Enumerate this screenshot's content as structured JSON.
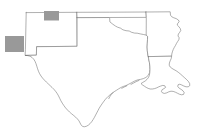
{
  "figure": {
    "background_color": "#ffffff",
    "width": 205,
    "height": 140
  },
  "map": {
    "projection_note": "plate-carree-like outline map",
    "outline_color": "#6e6e6e",
    "outline_width": 0.55,
    "fill_color": "#ffffff",
    "states": [
      {
        "id": "new-mexico",
        "name": "New Mexico"
      },
      {
        "id": "texas",
        "name": "Texas"
      },
      {
        "id": "oklahoma",
        "name": "Oklahoma"
      },
      {
        "id": "arkansas",
        "name": "Arkansas"
      },
      {
        "id": "louisiana",
        "name": "Louisiana"
      }
    ],
    "highlight_color": "#999999",
    "highlight_regions": [
      {
        "id": "highlight-region-north",
        "label": "Northern highlighted study area",
        "state": "New Mexico",
        "x": 44.0,
        "y": 11.0,
        "width": 15.0,
        "height": 9.5
      },
      {
        "id": "highlight-region-west",
        "label": "Western highlighted study area",
        "state": "New Mexico",
        "x": 5.0,
        "y": 36.0,
        "width": 19.0,
        "height": 16.0
      }
    ]
  },
  "geometry": {
    "new_mexico": "M 26.0 12.4 L 77.0 12.1 L 77.3 17.5 L 77.4 46.0 L 36.5 46.5 L 36.3 55.0 L 25.0 55.2 L 25.2 50.0 L 26.0 12.4 Z",
    "texas": "M 77.4 17.5 L 110.0 17.4 L 110.2 21.6 L 115.5 26.5 L 120.0 28.0 L 124.0 30.5 L 129.5 31.0 L 134.0 33.0 L 139.5 33.5 L 144.0 34.6 L 147.5 35.2 L 149.0 37.0 L 148.5 41.0 L 148.0 46.0 L 148.2 50.5 L 149.0 56.0 L 150.2 62.0 L 150.6 67.5 L 150.4 72.0 L 149.0 76.0 L 146.0 78.8 L 142.0 80.2 L 138.0 81.0 L 133.0 83.0 L 128.5 85.5 L 125.0 88.0 L 121.5 89.0 L 118.0 90.5 L 114.5 92.5 L 111.0 95.0 L 108.0 97.5 L 105.5 100.0 L 103.0 103.0 L 100.5 106.5 L 98.5 110.0 L 96.5 113.5 L 94.5 117.0 L 92.5 120.5 L 90.5 123.5 L 88.0 126.0 L 85.0 127.8 L 82.0 128.2 L 79.5 126.5 L 78.0 123.5 L 76.5 120.0 L 74.0 117.0 L 71.0 114.5 L 68.0 112.0 L 65.0 109.0 L 62.5 105.5 L 60.0 102.0 L 58.0 98.5 L 56.5 95.0 L 55.0 91.5 L 53.0 88.5 L 50.5 86.0 L 48.0 83.5 L 45.5 81.0 L 43.0 78.5 L 40.5 76.0 L 38.0 73.5 L 36.0 70.5 L 34.5 67.0 L 33.5 63.5 L 32.5 60.0 L 31.0 57.5 L 28.5 56.0 L 25.0 55.2 L 36.3 55.0 L 36.5 46.5 L 77.4 46.0 L 77.3 17.5 Z",
    "oklahoma": "M 77.0 12.1 L 110.0 12.0 L 146.5 12.0 L 146.8 17.3 L 110.2 17.4 L 110.0 17.4 L 77.4 17.5 L 77.0 12.1 Z",
    "arkansas": "M 146.8 17.3 L 146.5 12.0 L 170.5 11.8 L 170.8 16.0 L 173.0 18.5 L 176.5 20.0 L 179.5 22.5 L 178.0 25.0 L 180.0 27.5 L 182.0 30.5 L 181.0 33.5 L 179.0 36.5 L 180.5 39.5 L 179.0 42.5 L 177.5 45.5 L 176.0 48.5 L 174.5 51.5 L 173.0 54.5 L 172.0 57.5 L 148.2 57.8 L 148.0 46.0 L 148.5 41.0 L 149.0 37.0 L 147.5 35.2 L 146.8 17.3 Z",
    "louisiana": "M 148.2 57.8 L 172.0 57.5 L 171.5 60.5 L 170.0 63.5 L 169.5 66.5 L 171.0 69.0 L 173.5 70.5 L 176.0 72.0 L 178.5 73.5 L 181.0 75.5 L 183.0 78.0 L 185.5 80.0 L 188.0 82.0 L 190.5 84.5 L 191.0 87.5 L 189.0 89.5 L 186.0 90.0 L 183.0 89.0 L 180.5 87.5 L 178.0 86.5 L 176.0 88.0 L 177.5 90.5 L 180.0 92.0 L 182.5 93.5 L 184.0 96.0 L 183.0 98.5 L 180.5 99.0 L 178.0 98.0 L 175.5 96.5 L 173.0 95.0 L 170.5 94.0 L 168.0 93.5 L 165.5 94.5 L 163.0 96.0 L 160.5 97.0 L 158.0 96.0 L 156.5 93.5 L 158.0 91.0 L 160.5 90.0 L 162.5 88.5 L 161.0 86.5 L 158.5 86.0 L 156.0 87.0 L 153.5 88.0 L 151.0 89.5 L 148.5 90.5 L 146.0 91.0 L 143.5 91.5 L 141.0 92.0 L 150.2 62.0 L 149.0 56.0 L 148.2 57.8 Z"
  }
}
